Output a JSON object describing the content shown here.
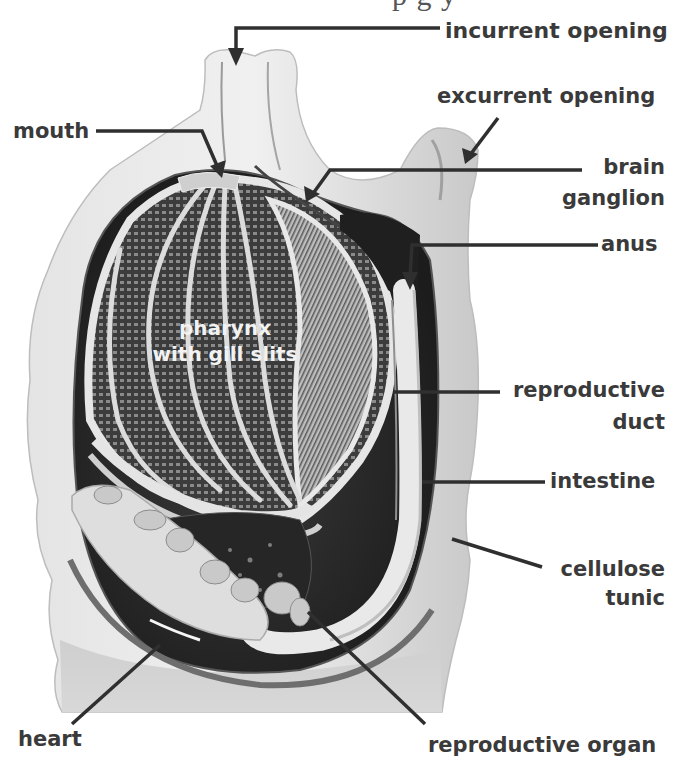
{
  "figure": {
    "top_text_fragment": "p g y",
    "colors": {
      "background": "#ffffff",
      "tunic": "#d9d9d9",
      "tunic_edge": "#bdbdbd",
      "cavity": "#2b2b2b",
      "pharynx_bars": "#e6e6e6",
      "label_text": "#3a3a3a",
      "leader_line": "#333333"
    }
  },
  "labels": {
    "incurrent_opening": "incurrent opening",
    "excurrent_opening": "excurrent opening",
    "mouth": "mouth",
    "brain_ganglion_line1": "brain",
    "brain_ganglion_line2": "ganglion",
    "anus": "anus",
    "pharynx_line1": "pharynx",
    "pharynx_line2": "with gill slits",
    "reproductive_duct_line1": "reproductive",
    "reproductive_duct_line2": "duct",
    "intestine": "intestine",
    "cellulose_tunic_line1": "cellulose",
    "cellulose_tunic_line2": "tunic",
    "heart": "heart",
    "reproductive_organ": "reproductive organ"
  }
}
